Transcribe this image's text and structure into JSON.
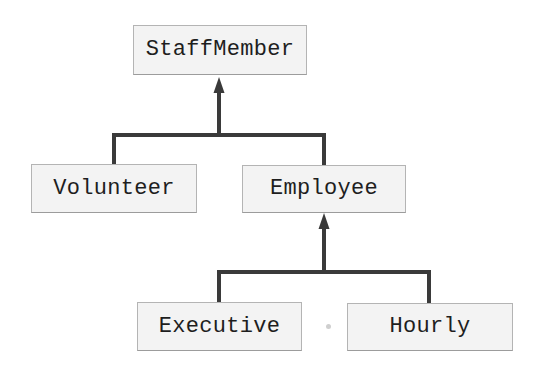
{
  "diagram": {
    "type": "class-hierarchy",
    "colors": {
      "box_fill": "#f3f3f3",
      "box_border": "#b4b4b4",
      "connector": "#3a3a3a",
      "text": "#1e1e1e"
    },
    "nodes": {
      "staff_member": {
        "label": "StaffMember"
      },
      "volunteer": {
        "label": "Volunteer"
      },
      "employee": {
        "label": "Employee"
      },
      "executive": {
        "label": "Executive"
      },
      "hourly": {
        "label": "Hourly"
      }
    },
    "edges": [
      {
        "from": "volunteer",
        "to": "staff_member",
        "kind": "inheritance"
      },
      {
        "from": "employee",
        "to": "staff_member",
        "kind": "inheritance"
      },
      {
        "from": "executive",
        "to": "employee",
        "kind": "inheritance"
      },
      {
        "from": "hourly",
        "to": "employee",
        "kind": "inheritance"
      }
    ]
  }
}
